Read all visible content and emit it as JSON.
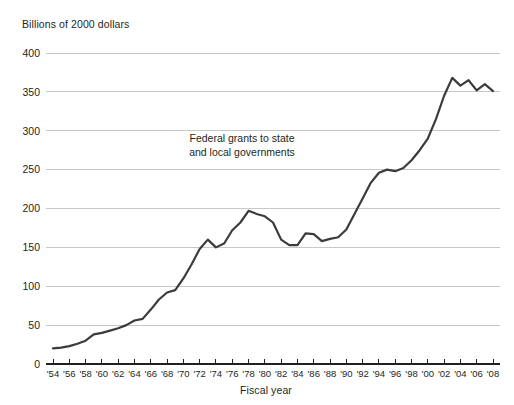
{
  "chart_data": {
    "type": "line",
    "title": "",
    "ylabel": "Billions of 2000 dollars",
    "xlabel": "Fiscal year",
    "annotation": "Federal grants to state and local governments",
    "annotation_line1": "Federal grants to state",
    "annotation_line2": "and local governments",
    "grid": "horizontal",
    "legend": "none",
    "line_color": "#3b3b3b",
    "grid_color": "#b9b9b9",
    "axis_color": "#231f20",
    "ylim": [
      0,
      400
    ],
    "yticks": [
      0,
      50,
      100,
      150,
      200,
      250,
      300,
      350,
      400
    ],
    "ytick_labels": [
      "0",
      "50",
      "100",
      "150",
      "200",
      "250",
      "300",
      "350",
      "400"
    ],
    "xlim": [
      1954,
      2008
    ],
    "xticks": [
      1954,
      1956,
      1958,
      1960,
      1962,
      1964,
      1966,
      1968,
      1970,
      1972,
      1974,
      1976,
      1978,
      1980,
      1982,
      1984,
      1986,
      1988,
      1990,
      1992,
      1994,
      1996,
      1998,
      2000,
      2002,
      2004,
      2006,
      2008
    ],
    "xtick_labels": [
      "'54",
      "'56",
      "'58",
      "'60",
      "'62",
      "'64",
      "'66",
      "'68",
      "'70",
      "'72",
      "'74",
      "'76",
      "'78",
      "'80",
      "'82",
      "'84",
      "'86",
      "'88",
      "'90",
      "'92",
      "'94",
      "'96",
      "'98",
      "'00",
      "'02",
      "'04",
      "'06",
      "'08"
    ],
    "x": [
      1954,
      1955,
      1956,
      1957,
      1958,
      1959,
      1960,
      1961,
      1962,
      1963,
      1964,
      1965,
      1966,
      1967,
      1968,
      1969,
      1970,
      1971,
      1972,
      1973,
      1974,
      1975,
      1976,
      1977,
      1978,
      1979,
      1980,
      1981,
      1982,
      1983,
      1984,
      1985,
      1986,
      1987,
      1988,
      1989,
      1990,
      1991,
      1992,
      1993,
      1994,
      1995,
      1996,
      1997,
      1998,
      1999,
      2000,
      2001,
      2002,
      2003,
      2004,
      2005,
      2006,
      2007,
      2008
    ],
    "values": [
      20,
      21,
      23,
      26,
      30,
      38,
      40,
      43,
      46,
      50,
      56,
      58,
      70,
      83,
      92,
      95,
      110,
      128,
      148,
      160,
      150,
      155,
      172,
      182,
      197,
      193,
      190,
      182,
      160,
      153,
      153,
      168,
      167,
      158,
      161,
      163,
      173,
      193,
      213,
      233,
      246,
      250,
      248,
      252,
      262,
      275,
      290,
      315,
      345,
      368,
      358,
      365,
      352,
      360,
      351
    ]
  }
}
